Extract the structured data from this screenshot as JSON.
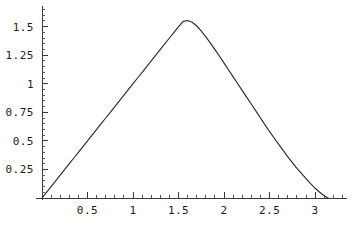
{
  "chart_data": {
    "type": "line",
    "title": "",
    "subtitle": "",
    "xlabel": "",
    "ylabel": "",
    "grid": false,
    "legend": false,
    "legend_position": "none",
    "xlim": [
      0,
      3.35
    ],
    "ylim": [
      0,
      1.68
    ],
    "xticks": [
      0.5,
      1,
      1.5,
      2,
      2.5,
      3
    ],
    "xtick_labels": [
      "0.5",
      "1",
      "1.5",
      "2",
      "2.5",
      "3"
    ],
    "xminor_per_major": 5,
    "yticks": [
      0.25,
      0.5,
      0.75,
      1,
      1.25,
      1.5
    ],
    "ytick_labels": [
      "0.25",
      "0.5",
      "0.75",
      "1",
      "1.25",
      "1.5"
    ],
    "yminor_per_major": 5,
    "series": [
      {
        "name": "curve",
        "color": "#2b2b2b",
        "x": [
          0,
          0.05,
          0.1,
          0.15,
          0.2,
          0.25,
          0.3,
          0.35,
          0.4,
          0.45,
          0.5,
          0.55,
          0.6,
          0.65,
          0.7,
          0.75,
          0.8,
          0.85,
          0.9,
          0.95,
          1.0,
          1.05,
          1.1,
          1.15,
          1.2,
          1.25,
          1.3,
          1.35,
          1.4,
          1.45,
          1.5,
          1.55,
          1.6,
          1.65,
          1.7,
          1.75,
          1.8,
          1.85,
          1.9,
          1.95,
          2.0,
          2.05,
          2.1,
          2.15,
          2.2,
          2.25,
          2.3,
          2.35,
          2.4,
          2.45,
          2.5,
          2.55,
          2.6,
          2.65,
          2.7,
          2.75,
          2.8,
          2.85,
          2.9,
          2.95,
          3.0,
          3.05,
          3.1,
          3.1416
        ],
        "y": [
          0.0,
          0.05,
          0.1,
          0.15,
          0.2,
          0.25,
          0.3,
          0.35,
          0.4,
          0.45,
          0.5,
          0.55,
          0.6,
          0.65,
          0.7,
          0.75,
          0.8,
          0.85,
          0.9,
          0.95,
          1.0,
          1.05,
          1.1,
          1.15,
          1.2,
          1.25,
          1.3,
          1.35,
          1.4,
          1.45,
          1.5,
          1.545,
          1.553,
          1.538,
          1.505,
          1.46,
          1.41,
          1.355,
          1.298,
          1.24,
          1.18,
          1.12,
          1.06,
          1.0,
          0.94,
          0.88,
          0.82,
          0.76,
          0.7,
          0.64,
          0.58,
          0.525,
          0.47,
          0.415,
          0.36,
          0.31,
          0.26,
          0.215,
          0.17,
          0.125,
          0.085,
          0.05,
          0.02,
          0.0
        ],
        "peak_x": 1.58,
        "peak_y": 1.553
      }
    ]
  },
  "axes": {
    "x_axis_name": "x-axis",
    "y_axis_name": "y-axis"
  }
}
